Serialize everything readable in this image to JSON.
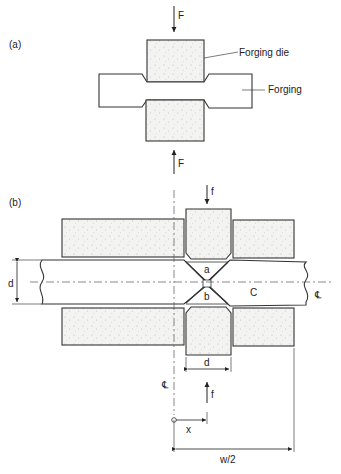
{
  "figure": {
    "panel_a": {
      "label": "(a)",
      "force_top": "F",
      "force_bottom": "F",
      "die_label": "Forging die",
      "forging_label": "Forging"
    },
    "panel_b": {
      "label": "(b)",
      "force_top": "f",
      "force_bottom": "f",
      "region_a": "a",
      "region_b": "b",
      "region_c": "C",
      "thickness_label": "d",
      "die_width_label": "d",
      "centerline_right": "℄",
      "centerline_bottom": "℄",
      "x_label": "x",
      "half_width_label": "w/2"
    }
  }
}
